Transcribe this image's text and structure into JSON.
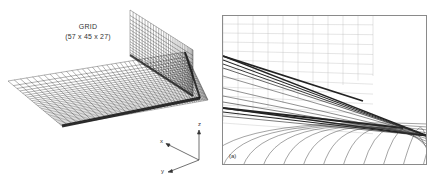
{
  "left_figure": {
    "title_line1": "GRID",
    "title_line2": "(57 x 45 x 27)",
    "axes": {
      "x_label": "x",
      "y_label": "y",
      "z_label": "z"
    },
    "description": "3D computational mesh: horizontal plate surface with a vertical wall at the rear-right corner"
  },
  "right_figure": {
    "panel_label": "(a)",
    "description": "Close-up perspective of grid lines converging at the wall-plate junction"
  },
  "colors": {
    "ink": "#1a1a1a",
    "frame": "#8a8a8a",
    "background": "#ffffff"
  }
}
